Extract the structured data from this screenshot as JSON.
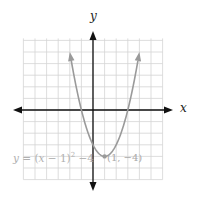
{
  "chart_data": {
    "type": "line",
    "title": "",
    "xlabel": "x",
    "ylabel": "y",
    "xlim": [
      -6,
      6
    ],
    "ylim": [
      -6,
      6
    ],
    "grid": true,
    "grid_step": 1,
    "tick_labels": "none",
    "series": [
      {
        "name": "y = (x − 1)² − 4",
        "function": "(x-1)^2-4",
        "x": [
          -2,
          -1,
          0,
          1,
          2,
          3,
          4
        ],
        "values": [
          5,
          0,
          -3,
          -4,
          -3,
          0,
          5
        ],
        "color": "#9a9a9a",
        "arrows_at_ends": true
      }
    ],
    "annotations": [
      {
        "text": "y = (x − 1)² − 4",
        "position": "lower-left"
      },
      {
        "text": "(1, −4)",
        "point": [
          1,
          -4
        ],
        "marker": true
      }
    ]
  },
  "labels": {
    "x_axis": "x",
    "y_axis": "y",
    "equation_parts": {
      "y": "y",
      "eq": " = (",
      "x": "x",
      "rest": " − 1)",
      "exp": "2",
      "tail": " −4"
    },
    "vertex": "(1, −4)"
  },
  "colors": {
    "axes": "#111111",
    "grid": "#d4d4d4",
    "curve": "#9a9a9a",
    "label_text": "#b0b0b0"
  }
}
